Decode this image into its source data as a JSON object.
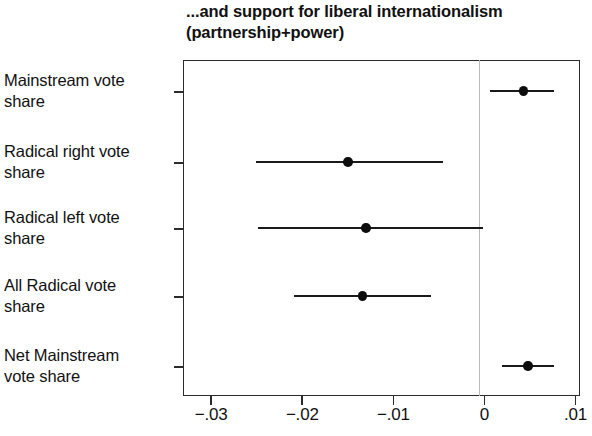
{
  "chart_data": {
    "type": "scatter",
    "title": "...and support for liberal internationalism\n(partnership+power)",
    "title_line1": "...and support for liberal internationalism",
    "title_line2": "(partnership+power)",
    "xlabel": "",
    "ylabel": "",
    "xlim": [
      -0.0331,
      0.0105
    ],
    "xticks": [
      -0.03,
      -0.02,
      -0.01,
      0,
      0.01
    ],
    "xticklabels": [
      "−.03",
      "−.02",
      "−.01",
      "0",
      ".01"
    ],
    "grid": false,
    "legend": null,
    "reference_line_x": 0,
    "categories": [
      "Mainstream vote\nshare",
      "Radical right vote\nshare",
      "Radical left vote\nshare",
      "All Radical vote\nshare",
      "Net Mainstream\nvote share"
    ],
    "points": [
      {
        "label": "Mainstream vote share",
        "estimate": 0.0043,
        "ci_low": 0.0006,
        "ci_high": 0.0076
      },
      {
        "label": "Radical right vote share",
        "estimate": -0.015,
        "ci_low": -0.0251,
        "ci_high": -0.0046
      },
      {
        "label": "Radical left vote share",
        "estimate": -0.013,
        "ci_low": -0.0249,
        "ci_high": -0.0001
      },
      {
        "label": "All Radical vote share",
        "estimate": -0.0134,
        "ci_low": -0.0209,
        "ci_high": -0.0059
      },
      {
        "label": "Net Mainstream vote share",
        "estimate": 0.0048,
        "ci_low": 0.0019,
        "ci_high": 0.0076
      }
    ],
    "colors": {
      "marker": "#0d0d0d",
      "ci": "#1a1a1a",
      "axis": "#2b2b2b",
      "reference_line": "#b9b9b9",
      "background": "#ffffff",
      "text": "#111111"
    }
  }
}
